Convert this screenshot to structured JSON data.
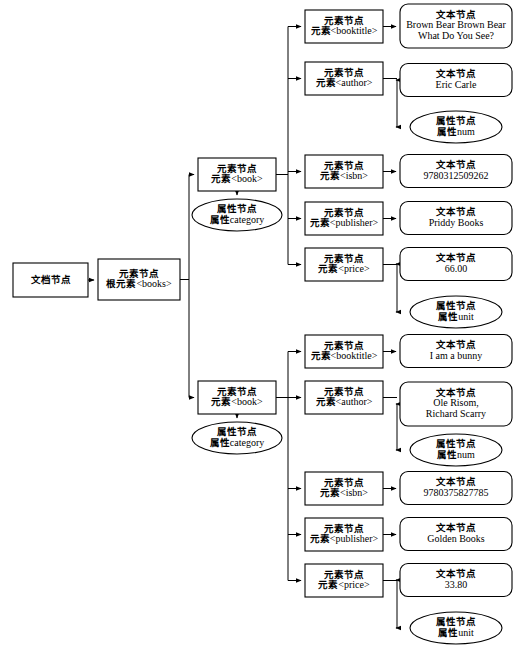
{
  "diagram": {
    "stroke_color": "#000000",
    "fill_color": "#ffffff",
    "labels": {
      "document_node": "文档节点",
      "element_node": "元素节点",
      "text_node": "文本节点",
      "attribute_node": "属性节点",
      "element_prefix": "元素",
      "root_element_prefix": "根元素",
      "attribute_prefix": "属性"
    }
  },
  "nodes": {
    "document": {
      "shape": "rect",
      "line1": "文档节点",
      "line2": ""
    },
    "root": {
      "shape": "rect",
      "line1": "元素节点",
      "line2_zh": "根元素",
      "line2_la": "<books>"
    },
    "book1": {
      "shape": "rect",
      "line1": "元素节点",
      "line2_zh": "元素",
      "line2_la": "<book>"
    },
    "book1_attr": {
      "shape": "ellipse",
      "line1": "属性节点",
      "line2_zh": "属性",
      "line2_la": "category"
    },
    "book2": {
      "shape": "rect",
      "line1": "元素节点",
      "line2_zh": "元素",
      "line2_la": "<book>"
    },
    "book2_attr": {
      "shape": "ellipse",
      "line1": "属性节点",
      "line2_zh": "属性",
      "line2_la": "category"
    }
  },
  "books": [
    {
      "index": 1,
      "fields": [
        {
          "element": {
            "line1": "元素节点",
            "zh": "元素",
            "la": "<booktitle>"
          },
          "children": [
            {
              "kind": "text",
              "shape": "roundrect",
              "line1": "文本节点",
              "values": [
                "Brown Bear Brown Bear",
                "What Do You See?"
              ]
            }
          ]
        },
        {
          "element": {
            "line1": "元素节点",
            "zh": "元素",
            "la": "<author>"
          },
          "children": [
            {
              "kind": "text",
              "shape": "roundrect",
              "line1": "文本节点",
              "values": [
                "Eric Carle"
              ]
            },
            {
              "kind": "attribute",
              "shape": "ellipse",
              "line1": "属性节点",
              "zh": "属性",
              "la": "num"
            }
          ]
        },
        {
          "element": {
            "line1": "元素节点",
            "zh": "元素",
            "la": "<isbn>"
          },
          "children": [
            {
              "kind": "text",
              "shape": "roundrect",
              "line1": "文本节点",
              "values": [
                "9780312509262"
              ]
            }
          ]
        },
        {
          "element": {
            "line1": "元素节点",
            "zh": "元素",
            "la": "<publisher>"
          },
          "children": [
            {
              "kind": "text",
              "shape": "roundrect",
              "line1": "文本节点",
              "values": [
                "Priddy Books"
              ]
            }
          ]
        },
        {
          "element": {
            "line1": "元素节点",
            "zh": "元素",
            "la": "<price>"
          },
          "children": [
            {
              "kind": "text",
              "shape": "roundrect",
              "line1": "文本节点",
              "values": [
                "66.00"
              ]
            },
            {
              "kind": "attribute",
              "shape": "ellipse",
              "line1": "属性节点",
              "zh": "属性",
              "la": "unit"
            }
          ]
        }
      ]
    },
    {
      "index": 2,
      "fields": [
        {
          "element": {
            "line1": "元素节点",
            "zh": "元素",
            "la": "<booktitle>"
          },
          "children": [
            {
              "kind": "text",
              "shape": "roundrect",
              "line1": "文本节点",
              "values": [
                "I am a bunny"
              ]
            }
          ]
        },
        {
          "element": {
            "line1": "元素节点",
            "zh": "元素",
            "la": "<author>"
          },
          "children": [
            {
              "kind": "text",
              "shape": "roundrect",
              "line1": "文本节点",
              "values": [
                "Ole Risom,",
                "Richard Scarry"
              ]
            },
            {
              "kind": "attribute",
              "shape": "ellipse",
              "line1": "属性节点",
              "zh": "属性",
              "la": "num"
            }
          ]
        },
        {
          "element": {
            "line1": "元素节点",
            "zh": "元素",
            "la": "<isbn>"
          },
          "children": [
            {
              "kind": "text",
              "shape": "roundrect",
              "line1": "文本节点",
              "values": [
                "9780375827785"
              ]
            }
          ]
        },
        {
          "element": {
            "line1": "元素节点",
            "zh": "元素",
            "la": "<publisher>"
          },
          "children": [
            {
              "kind": "text",
              "shape": "roundrect",
              "line1": "文本节点",
              "values": [
                "Golden Books"
              ]
            }
          ]
        },
        {
          "element": {
            "line1": "元素节点",
            "zh": "元素",
            "la": "<price>"
          },
          "children": [
            {
              "kind": "text",
              "shape": "roundrect",
              "line1": "文本节点",
              "values": [
                "33.80"
              ]
            },
            {
              "kind": "attribute",
              "shape": "ellipse",
              "line1": "属性节点",
              "zh": "属性",
              "la": "unit"
            }
          ]
        }
      ]
    }
  ]
}
